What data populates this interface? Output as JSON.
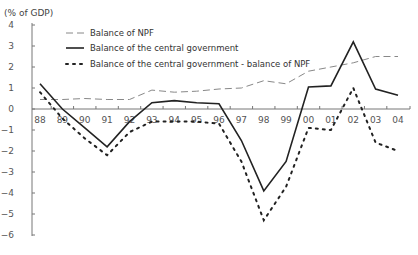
{
  "chart_data": {
    "type": "line",
    "title": "",
    "ylabel": "(% of GDP)",
    "xlabel": "",
    "ylim": [
      -6,
      4
    ],
    "yticks": [
      4,
      3,
      2,
      1,
      0,
      -1,
      -2,
      -3,
      -4,
      -5,
      -6
    ],
    "ytick_labels": [
      "4",
      "3",
      "2",
      "1",
      "0",
      "−1",
      "−2",
      "−3",
      "−4",
      "−5",
      "−6"
    ],
    "categories": [
      "88",
      "89",
      "90",
      "91",
      "92",
      "93",
      "94",
      "95",
      "96",
      "97",
      "98",
      "99",
      "00",
      "01",
      "02",
      "03",
      "04"
    ],
    "grid": false,
    "legend_position": "upper-left",
    "series": [
      {
        "name": "Balance of NPF",
        "style": "dashed",
        "color": "#888888",
        "values": [
          0.45,
          0.45,
          0.5,
          0.45,
          0.45,
          0.9,
          0.8,
          0.85,
          0.95,
          1.0,
          1.35,
          1.2,
          1.8,
          2.0,
          2.2,
          2.5,
          2.5
        ]
      },
      {
        "name": "Balance of the central government",
        "style": "solid",
        "color": "#222222",
        "values": [
          1.2,
          0.0,
          -0.9,
          -1.8,
          -0.6,
          0.3,
          0.4,
          0.3,
          0.25,
          -1.5,
          -3.9,
          -2.5,
          1.05,
          1.1,
          3.2,
          0.95,
          0.65
        ]
      },
      {
        "name": "Balance of the central government - balance of NPF",
        "style": "dotted",
        "color": "#222222",
        "values": [
          0.8,
          -0.45,
          -1.4,
          -2.2,
          -1.1,
          -0.6,
          -0.6,
          -0.6,
          -0.7,
          -2.5,
          -5.3,
          -3.7,
          -0.9,
          -1.0,
          1.0,
          -1.6,
          -2.0
        ]
      }
    ]
  }
}
